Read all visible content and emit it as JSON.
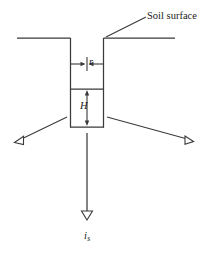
{
  "figure": {
    "background_color": "#ffffff",
    "line_color": "#3a3a3a",
    "text_color": "#1a1a1a",
    "width": 210,
    "height": 254
  },
  "labels": {
    "soil_surface": "Soil surface",
    "radius": "r",
    "depth": "H",
    "flux_symbol": "i",
    "flux_subscript": "s"
  },
  "diagram_data": {
    "type": "engineering-schematic",
    "subject": "Cylindrical shaft / borehole in soil with downward infiltration flux",
    "elements": [
      {
        "name": "soil-surface-left",
        "kind": "horizontal-line",
        "x1": 17,
        "y1": 38,
        "x2": 70,
        "y2": 38
      },
      {
        "name": "soil-surface-right",
        "kind": "horizontal-line",
        "x1": 104,
        "y1": 38,
        "x2": 175,
        "y2": 38
      },
      {
        "name": "shaft-wall-left",
        "kind": "vertical-line",
        "x1": 70,
        "y1": 38,
        "x2": 70,
        "y2": 127
      },
      {
        "name": "shaft-wall-right",
        "kind": "vertical-line",
        "x1": 104,
        "y1": 38,
        "x2": 104,
        "y2": 127
      },
      {
        "name": "shaft-divider",
        "kind": "horizontal-line",
        "x1": 70,
        "y1": 89,
        "x2": 104,
        "y2": 89
      },
      {
        "name": "shaft-bottom",
        "kind": "horizontal-line",
        "x1": 70,
        "y1": 127,
        "x2": 104,
        "y2": 127
      },
      {
        "name": "radius-dimension",
        "kind": "inward-double-arrow-horizontal",
        "y": 64,
        "left_from": 70,
        "left_to": 84,
        "right_from": 104,
        "right_to": 90,
        "center_tick_x": 87
      },
      {
        "name": "depth-dimension",
        "kind": "double-arrow-vertical",
        "x": 87,
        "y1": 91,
        "y2": 125
      },
      {
        "name": "soil-surface-leader",
        "kind": "leader-line",
        "x1": 146,
        "y1": 17,
        "x2": 106,
        "y2": 37
      },
      {
        "name": "left-soil-pointer",
        "kind": "open-triangle-arrow",
        "x1": 66,
        "y1": 117,
        "x2": 18,
        "y2": 140
      },
      {
        "name": "right-soil-pointer",
        "kind": "open-triangle-arrow",
        "x1": 108,
        "y1": 117,
        "x2": 190,
        "y2": 140
      },
      {
        "name": "flux-arrow",
        "kind": "open-triangle-arrow-vertical",
        "x": 87,
        "y1": 133,
        "y2": 218
      }
    ]
  }
}
